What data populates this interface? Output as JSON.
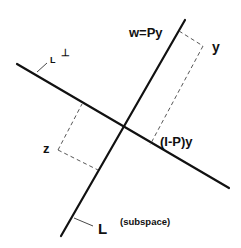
{
  "diagram": {
    "type": "orthogonal-projection",
    "labels": {
      "w": "w=Py",
      "y": "y",
      "z": "z",
      "residual": "(I-P)y",
      "subspace": "L",
      "subspace_note": "(subspace)",
      "complement_base": "L",
      "complement_sup": "⊥"
    },
    "colors": {
      "line": "#111111",
      "dashed": "#444444",
      "background": "#ffffff"
    }
  }
}
